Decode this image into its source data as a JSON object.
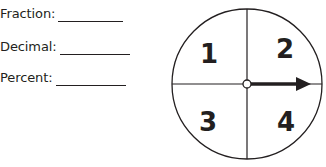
{
  "answer_fields": [
    {
      "label": "Fraction:",
      "value": ""
    },
    {
      "label": "Decimal:",
      "value": ""
    },
    {
      "label": "Percent:",
      "value": ""
    }
  ],
  "spinner": {
    "sections": [
      "1",
      "2",
      "3",
      "4"
    ],
    "arrow_points_to": "right",
    "colors": {
      "stroke": "#231f20",
      "fill": "#ffffff"
    }
  }
}
